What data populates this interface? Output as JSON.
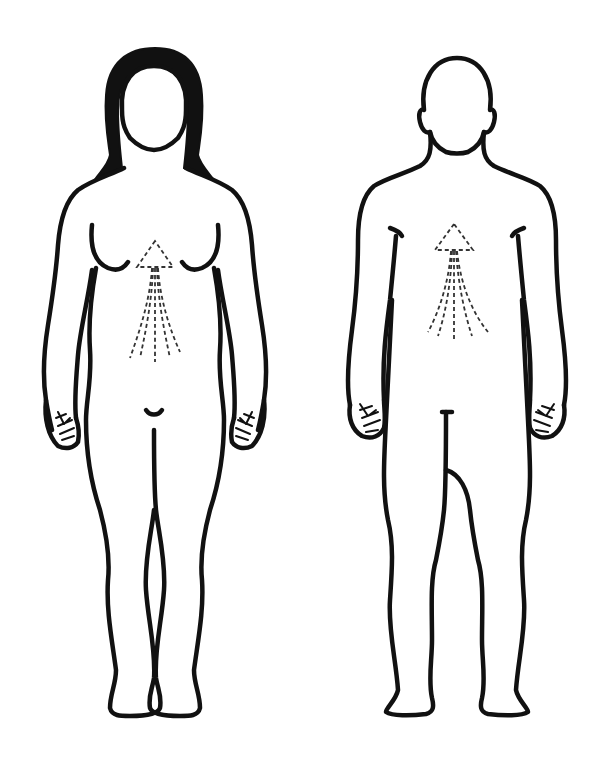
{
  "figures": [
    {
      "id": "female",
      "label": "",
      "arrow_direction": "up"
    },
    {
      "id": "male",
      "label": "",
      "arrow_direction": "up"
    }
  ],
  "colors": {
    "line": "#111111",
    "background": "#ffffff",
    "dash": "#333333"
  }
}
